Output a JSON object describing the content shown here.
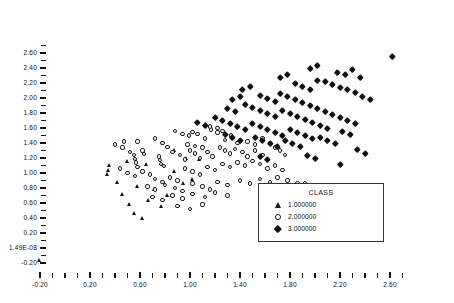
{
  "chart_data": {
    "type": "scatter",
    "title": "",
    "xlabel": "",
    "ylabel": "",
    "xlim": [
      -0.32,
      2.78
    ],
    "ylim": [
      -0.28,
      2.72
    ],
    "grid": false,
    "xticks": [
      -0.2,
      0.2,
      0.6,
      1.0,
      1.4,
      1.8,
      2.2,
      2.6
    ],
    "xticklabels": [
      "-0.20",
      "0.20",
      "0.60",
      "1.00",
      "1.40",
      "1.80",
      "2.20",
      "2.60"
    ],
    "yticks": [
      -0.2,
      0.0,
      0.2,
      0.4,
      0.6,
      0.8,
      1.0,
      1.2,
      1.4,
      1.6,
      1.8,
      2.0,
      2.2,
      2.4,
      2.6
    ],
    "yticklabels": [
      "-0.20",
      "1.49E-08",
      "0.20",
      "0.40",
      "0.60",
      "0.80",
      "1.00",
      "1.20",
      "1.40",
      "1.60",
      "1.80",
      "2.00",
      "2.20",
      "2.40",
      "2.60"
    ],
    "minor_tick_subdivisions": 2,
    "legend": {
      "title": "CLASS",
      "position": "lower-right",
      "entries": [
        {
          "label": "1.000000",
          "marker": "triangle",
          "color": "#121212",
          "filled": true
        },
        {
          "label": "2.000000",
          "marker": "circle",
          "color": "#161616",
          "filled": false
        },
        {
          "label": "3.000000",
          "marker": "diamond",
          "color": "#111111",
          "filled": true
        }
      ]
    },
    "series": [
      {
        "name": "1.000000",
        "marker": "triangle",
        "color": "#121212",
        "points": [
          [
            -0.2,
            -0.17
          ],
          [
            0.34,
            0.98
          ],
          [
            0.35,
            1.04
          ],
          [
            0.36,
            1.1
          ],
          [
            0.42,
            0.88
          ],
          [
            0.46,
            0.72
          ],
          [
            0.52,
            0.58
          ],
          [
            0.56,
            0.46
          ],
          [
            0.62,
            0.4
          ],
          [
            0.67,
            0.64
          ],
          [
            0.72,
            0.78
          ],
          [
            0.77,
            0.56
          ],
          [
            0.82,
            0.7
          ],
          [
            0.88,
            1.02
          ],
          [
            0.95,
            0.86
          ],
          [
            1.02,
            0.92
          ],
          [
            0.58,
            0.82
          ],
          [
            0.65,
            1.12
          ],
          [
            0.5,
            1.16
          ],
          [
            0.88,
            1.3
          ],
          [
            0.97,
            1.2
          ],
          [
            1.08,
            1.18
          ]
        ]
      },
      {
        "name": "2.000000",
        "marker": "circle",
        "color": "#161616",
        "points": [
          [
            0.47,
            1.42
          ],
          [
            0.58,
            1.42
          ],
          [
            0.72,
            1.46
          ],
          [
            0.78,
            1.4
          ],
          [
            0.82,
            1.35
          ],
          [
            0.88,
            1.56
          ],
          [
            0.94,
            1.52
          ],
          [
            0.99,
            1.5
          ],
          [
            1.02,
            1.55
          ],
          [
            1.06,
            1.52
          ],
          [
            1.12,
            1.46
          ],
          [
            1.17,
            1.58
          ],
          [
            1.22,
            1.54
          ],
          [
            1.28,
            1.44
          ],
          [
            1.33,
            1.5
          ],
          [
            1.38,
            1.4
          ],
          [
            0.52,
            1.28
          ],
          [
            0.55,
            1.24
          ],
          [
            0.56,
            1.19
          ],
          [
            0.57,
            1.14
          ],
          [
            0.58,
            1.08
          ],
          [
            0.62,
            1.3
          ],
          [
            0.63,
            1.25
          ],
          [
            0.75,
            1.22
          ],
          [
            0.76,
            1.17
          ],
          [
            0.77,
            1.12
          ],
          [
            0.79,
            1.09
          ],
          [
            0.86,
            1.28
          ],
          [
            0.92,
            1.24
          ],
          [
            0.96,
            1.18
          ],
          [
            1.0,
            1.3
          ],
          [
            1.04,
            1.26
          ],
          [
            1.08,
            1.2
          ],
          [
            1.14,
            1.28
          ],
          [
            1.18,
            1.22
          ],
          [
            1.24,
            1.34
          ],
          [
            1.28,
            1.3
          ],
          [
            1.32,
            1.26
          ],
          [
            1.36,
            1.32
          ],
          [
            1.42,
            1.28
          ],
          [
            1.46,
            1.22
          ],
          [
            1.52,
            1.3
          ],
          [
            1.58,
            1.24
          ],
          [
            0.44,
            1.06
          ],
          [
            0.5,
            1.0
          ],
          [
            0.56,
            0.96
          ],
          [
            0.62,
            1.02
          ],
          [
            0.68,
            0.98
          ],
          [
            0.72,
            0.92
          ],
          [
            0.78,
            0.88
          ],
          [
            0.84,
            0.94
          ],
          [
            0.9,
            0.9
          ],
          [
            0.96,
            1.06
          ],
          [
            1.02,
            1.02
          ],
          [
            1.08,
            0.98
          ],
          [
            1.14,
            1.08
          ],
          [
            1.2,
            1.04
          ],
          [
            1.26,
            1.12
          ],
          [
            1.32,
            1.08
          ],
          [
            1.38,
            1.14
          ],
          [
            1.44,
            1.1
          ],
          [
            1.5,
            1.16
          ],
          [
            1.56,
            1.12
          ],
          [
            1.62,
            1.06
          ],
          [
            1.68,
            1.1
          ],
          [
            1.74,
            1.04
          ],
          [
            0.66,
            0.82
          ],
          [
            0.72,
            0.78
          ],
          [
            0.8,
            0.84
          ],
          [
            0.88,
            0.8
          ],
          [
            0.94,
            0.76
          ],
          [
            1.02,
            0.86
          ],
          [
            1.1,
            0.82
          ],
          [
            1.16,
            0.78
          ],
          [
            1.22,
            0.88
          ],
          [
            1.3,
            0.84
          ],
          [
            1.4,
            0.9
          ],
          [
            1.48,
            0.86
          ],
          [
            1.56,
            0.92
          ],
          [
            1.64,
            0.88
          ],
          [
            1.7,
            0.94
          ],
          [
            1.78,
            0.9
          ],
          [
            1.86,
            0.86
          ],
          [
            1.92,
            0.86
          ],
          [
            0.7,
            0.68
          ],
          [
            0.78,
            0.64
          ],
          [
            0.86,
            0.7
          ],
          [
            0.94,
            0.66
          ],
          [
            1.02,
            0.72
          ],
          [
            1.12,
            0.68
          ],
          [
            1.2,
            0.74
          ],
          [
            1.3,
            0.7
          ],
          [
            0.9,
            0.56
          ],
          [
            1.0,
            0.52
          ],
          [
            1.1,
            0.58
          ],
          [
            1.46,
            1.42
          ],
          [
            1.52,
            1.38
          ],
          [
            1.58,
            1.46
          ],
          [
            1.64,
            1.4
          ],
          [
            1.68,
            1.34
          ],
          [
            1.72,
            1.3
          ],
          [
            1.76,
            1.24
          ],
          [
            0.98,
            1.38
          ],
          [
            1.04,
            1.36
          ],
          [
            1.1,
            1.34
          ],
          [
            1.16,
            1.62
          ],
          [
            1.22,
            1.6
          ],
          [
            1.26,
            1.56
          ],
          [
            0.46,
            1.34
          ],
          [
            0.4,
            1.38
          ]
        ]
      },
      {
        "name": "3.000000",
        "marker": "diamond",
        "color": "#111111",
        "points": [
          [
            2.62,
            2.56
          ],
          [
            2.18,
            2.34
          ],
          [
            2.24,
            2.32
          ],
          [
            2.3,
            2.38
          ],
          [
            2.36,
            2.28
          ],
          [
            2.02,
            2.24
          ],
          [
            2.08,
            2.22
          ],
          [
            2.14,
            2.18
          ],
          [
            2.2,
            2.14
          ],
          [
            2.26,
            2.12
          ],
          [
            2.32,
            2.08
          ],
          [
            2.38,
            2.02
          ],
          [
            2.44,
            1.98
          ],
          [
            1.84,
            2.2
          ],
          [
            1.9,
            2.16
          ],
          [
            1.96,
            2.12
          ],
          [
            1.72,
            2.06
          ],
          [
            1.78,
            2.02
          ],
          [
            1.84,
            1.98
          ],
          [
            1.9,
            1.94
          ],
          [
            1.96,
            1.9
          ],
          [
            2.02,
            1.86
          ],
          [
            2.08,
            1.82
          ],
          [
            2.14,
            1.78
          ],
          [
            2.2,
            1.74
          ],
          [
            2.26,
            1.7
          ],
          [
            2.32,
            1.66
          ],
          [
            1.56,
            2.04
          ],
          [
            1.62,
            2.0
          ],
          [
            1.68,
            1.96
          ],
          [
            1.44,
            1.92
          ],
          [
            1.5,
            1.88
          ],
          [
            1.56,
            1.84
          ],
          [
            1.62,
            1.8
          ],
          [
            1.68,
            1.76
          ],
          [
            1.74,
            1.84
          ],
          [
            1.8,
            1.8
          ],
          [
            1.86,
            1.76
          ],
          [
            1.92,
            1.72
          ],
          [
            1.98,
            1.68
          ],
          [
            2.04,
            1.64
          ],
          [
            2.1,
            1.6
          ],
          [
            1.3,
            1.86
          ],
          [
            1.36,
            1.82
          ],
          [
            1.2,
            1.74
          ],
          [
            1.26,
            1.7
          ],
          [
            1.32,
            1.66
          ],
          [
            1.38,
            1.62
          ],
          [
            1.44,
            1.58
          ],
          [
            1.5,
            1.66
          ],
          [
            1.56,
            1.62
          ],
          [
            1.62,
            1.58
          ],
          [
            1.68,
            1.54
          ],
          [
            1.74,
            1.5
          ],
          [
            1.8,
            1.58
          ],
          [
            1.86,
            1.54
          ],
          [
            1.92,
            1.5
          ],
          [
            1.98,
            1.46
          ],
          [
            1.06,
            1.68
          ],
          [
            1.12,
            1.64
          ],
          [
            1.28,
            1.52
          ],
          [
            1.34,
            1.48
          ],
          [
            1.4,
            1.44
          ],
          [
            1.52,
            1.48
          ],
          [
            1.58,
            1.44
          ],
          [
            1.64,
            1.4
          ],
          [
            1.7,
            1.36
          ],
          [
            1.76,
            1.44
          ],
          [
            1.82,
            1.4
          ],
          [
            1.88,
            1.36
          ],
          [
            2.04,
            1.48
          ],
          [
            2.1,
            1.44
          ],
          [
            2.16,
            1.4
          ],
          [
            2.22,
            1.56
          ],
          [
            2.28,
            1.52
          ],
          [
            2.34,
            1.32
          ],
          [
            2.4,
            1.26
          ],
          [
            1.94,
            1.24
          ],
          [
            2.0,
            1.2
          ],
          [
            1.56,
            1.22
          ],
          [
            1.62,
            1.18
          ],
          [
            2.2,
            1.12
          ],
          [
            1.42,
            2.12
          ],
          [
            1.48,
            2.16
          ],
          [
            1.72,
            2.28
          ],
          [
            1.78,
            2.32
          ],
          [
            1.96,
            2.4
          ],
          [
            2.02,
            2.44
          ],
          [
            1.34,
            1.98
          ],
          [
            1.4,
            2.02
          ]
        ]
      }
    ]
  }
}
